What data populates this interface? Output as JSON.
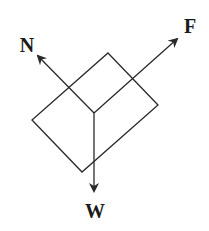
{
  "diagram": {
    "type": "free-body-diagram",
    "colors": {
      "stroke": "#2a2a2a",
      "label": "#1a1a1a",
      "background": "#ffffff"
    },
    "block": {
      "shape": "tilted-rectangle",
      "vertices": {
        "top": [
          108,
          53
        ],
        "right": [
          158,
          105
        ],
        "bottom": [
          82,
          172
        ],
        "left": [
          32,
          120
        ]
      }
    },
    "origin": [
      94,
      113
    ],
    "forces": [
      {
        "name": "N",
        "label": "N",
        "from": [
          94,
          113
        ],
        "to": [
          36,
          54
        ],
        "label_pos": [
          27,
          52
        ]
      },
      {
        "name": "F",
        "label": "F",
        "from": [
          94,
          113
        ],
        "to": [
          179,
          37
        ],
        "label_pos": [
          190,
          33
        ]
      },
      {
        "name": "W",
        "label": "W",
        "from": [
          94,
          113
        ],
        "to": [
          94,
          193
        ],
        "label_pos": [
          95,
          218
        ]
      }
    ]
  }
}
